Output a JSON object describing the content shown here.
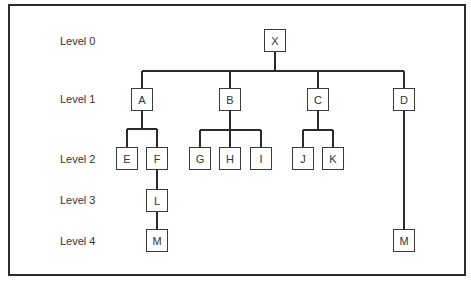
{
  "diagram": {
    "type": "tree",
    "levels": [
      {
        "label": "Level 0",
        "y": 41
      },
      {
        "label": "Level 1",
        "y": 99
      },
      {
        "label": "Level 2",
        "y": 159
      },
      {
        "label": "Level 3",
        "y": 200
      },
      {
        "label": "Level 4",
        "y": 241
      }
    ],
    "nodes": {
      "X": {
        "label": "X",
        "x": 264,
        "y": 29,
        "level": 0
      },
      "A": {
        "label": "A",
        "x": 131,
        "y": 88,
        "level": 1,
        "parent": "X"
      },
      "B": {
        "label": "B",
        "x": 219,
        "y": 88,
        "level": 1,
        "parent": "X"
      },
      "C": {
        "label": "C",
        "x": 307,
        "y": 88,
        "level": 1,
        "parent": "X"
      },
      "D": {
        "label": "D",
        "x": 393,
        "y": 88,
        "level": 1,
        "parent": "X"
      },
      "E": {
        "label": "E",
        "x": 116,
        "y": 147,
        "level": 2,
        "parent": "A"
      },
      "F": {
        "label": "F",
        "x": 146,
        "y": 147,
        "level": 2,
        "parent": "A"
      },
      "G": {
        "label": "G",
        "x": 189,
        "y": 147,
        "level": 2,
        "parent": "B"
      },
      "H": {
        "label": "H",
        "x": 219,
        "y": 147,
        "level": 2,
        "parent": "B"
      },
      "I": {
        "label": "I",
        "x": 250,
        "y": 147,
        "level": 2,
        "parent": "B"
      },
      "J": {
        "label": "J",
        "x": 292,
        "y": 147,
        "level": 2,
        "parent": "C"
      },
      "K": {
        "label": "K",
        "x": 322,
        "y": 147,
        "level": 2,
        "parent": "C"
      },
      "L": {
        "label": "L",
        "x": 146,
        "y": 189,
        "level": 3,
        "parent": "F"
      },
      "M1": {
        "label": "M",
        "x": 146,
        "y": 229,
        "level": 4,
        "parent": "L"
      },
      "M2": {
        "label": "M",
        "x": 393,
        "y": 229,
        "level": 4,
        "parent": "D"
      }
    }
  }
}
